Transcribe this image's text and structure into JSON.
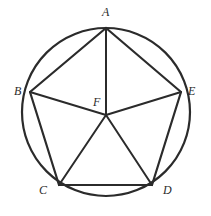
{
  "figure": {
    "background_color": "#ffffff",
    "stroke_color": "#2b2b2b",
    "label_color": "#2b2b2b",
    "circle": {
      "center_x": 106,
      "center_y": 112,
      "radius": 84,
      "stroke_width": 2.2
    },
    "points": [
      {
        "id": "A",
        "label": "A",
        "x": 106,
        "y": 28,
        "label_x": 102,
        "label_y": 6,
        "role": "vertex"
      },
      {
        "id": "B",
        "label": "B",
        "x": 30,
        "y": 92,
        "label_x": 14,
        "label_y": 85,
        "role": "vertex"
      },
      {
        "id": "C",
        "label": "C",
        "x": 59,
        "y": 185,
        "label_x": 39,
        "label_y": 184,
        "role": "vertex"
      },
      {
        "id": "D",
        "label": "D",
        "x": 152,
        "y": 185,
        "label_x": 163,
        "label_y": 184,
        "role": "vertex"
      },
      {
        "id": "E",
        "label": "E",
        "x": 181,
        "y": 92,
        "label_x": 188,
        "label_y": 85,
        "role": "vertex"
      },
      {
        "id": "F",
        "label": "F",
        "x": 106,
        "y": 115,
        "label_x": 93,
        "label_y": 96,
        "role": "center"
      }
    ],
    "segments": [
      {
        "name": "side-AB",
        "from": "A",
        "to": "B",
        "stroke_width": 2.2
      },
      {
        "name": "side-BC",
        "from": "B",
        "to": "C",
        "stroke_width": 2.2
      },
      {
        "name": "side-CD",
        "from": "C",
        "to": "D",
        "stroke_width": 2.2
      },
      {
        "name": "side-DE",
        "from": "D",
        "to": "E",
        "stroke_width": 2.2
      },
      {
        "name": "side-EA",
        "from": "E",
        "to": "A",
        "stroke_width": 2.2
      },
      {
        "name": "radius-FA",
        "from": "F",
        "to": "A",
        "stroke_width": 2.0
      },
      {
        "name": "radius-FB",
        "from": "F",
        "to": "B",
        "stroke_width": 2.0
      },
      {
        "name": "radius-FC",
        "from": "F",
        "to": "C",
        "stroke_width": 2.0
      },
      {
        "name": "radius-FD",
        "from": "F",
        "to": "D",
        "stroke_width": 2.0
      },
      {
        "name": "radius-FE",
        "from": "F",
        "to": "E",
        "stroke_width": 2.0
      }
    ]
  }
}
